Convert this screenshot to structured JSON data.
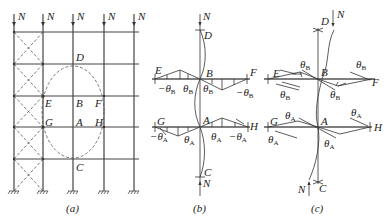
{
  "figure": {
    "panels": [
      {
        "id": "a",
        "caption": "(a)",
        "loads": [
          "N",
          "N",
          "N",
          "N",
          "N"
        ],
        "node_labels": {
          "D": "D",
          "E": "E",
          "B": "B",
          "F": "F",
          "G": "G",
          "A": "A",
          "H": "H",
          "C": "C"
        }
      },
      {
        "id": "b",
        "caption": "(b)",
        "top_load": "N",
        "bottom_load": "N",
        "node_labels": {
          "D": "D",
          "E": "E",
          "B": "B",
          "F": "F",
          "G": "G",
          "A": "A",
          "H": "H",
          "C": "C"
        },
        "rotations": {
          "upper": [
            "-θB",
            "θB",
            "θB",
            "-θB"
          ],
          "lower": [
            "-θA",
            "θA",
            "θA",
            "-θA"
          ]
        }
      },
      {
        "id": "c",
        "caption": "(c)",
        "top_load": "N",
        "bottom_load": "N",
        "node_labels": {
          "D": "D",
          "E": "E",
          "B": "B",
          "F": "F",
          "G": "G",
          "A": "A",
          "H": "H",
          "C": "C"
        },
        "rotations": {
          "upper": [
            "θB",
            "θB",
            "θB",
            "θB"
          ],
          "lower": [
            "θA",
            "θA",
            "θA",
            "θA"
          ]
        }
      }
    ],
    "symbols": {
      "theta": "θ",
      "sub_A": "A",
      "sub_B": "B",
      "minus": "−"
    }
  }
}
